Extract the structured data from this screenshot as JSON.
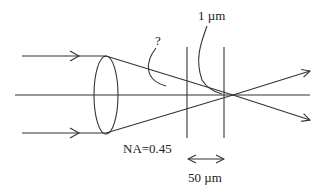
{
  "diagram": {
    "labels": {
      "question": "?",
      "spot_size": "1 µm",
      "numerical_aperture": "NA=0.45",
      "distance": "50 µm"
    },
    "elements": {
      "incoming_rays": 2,
      "optical_axis": true,
      "lens": "biconvex",
      "focal_planes": 2,
      "outgoing_rays": 2
    },
    "colors": {
      "stroke": "#333333",
      "text": "#222222",
      "background": "#ffffff"
    }
  }
}
